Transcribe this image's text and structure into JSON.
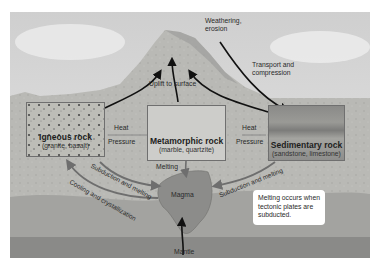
{
  "diagram": {
    "rocks": {
      "igneous": {
        "name": "Igneous rock",
        "examples": "(granite, basalt)"
      },
      "metamorphic": {
        "name": "Metamorphic rock",
        "examples": "(marble, quartzite)"
      },
      "sedimentary": {
        "name": "Sedimentary rock",
        "examples": "(sandstone, limestone)"
      }
    },
    "labels": {
      "weathering": "Weathering,",
      "erosion": "erosion",
      "transport_1": "Transport and",
      "transport_2": "compression",
      "uplift": "Uplift to surface",
      "heat_left": "Heat",
      "pressure_left": "Pressure",
      "heat_right": "Heat",
      "pressure_right": "Pressure",
      "melting": "Melting",
      "magma": "Magma",
      "mantle": "Mantle",
      "subduction_left": "Subduction and melting",
      "subduction_right": "Subduction and melting",
      "cooling": "Cooling and crystallization"
    },
    "note": {
      "line1": "Melting occurs when",
      "line2": "tectonic plates are",
      "line3": "subducted."
    },
    "colors": {
      "sky": "#dcdcdc",
      "mountain": "#c9c9c5",
      "crust": "#bdbdb9",
      "lower_crust": "#a3a3a0",
      "mantle": "#8a8a88",
      "magma": "#8c8c8a",
      "sea": "#a9a9a9",
      "arrow_black": "#111111",
      "arrow_gray": "#6e6e6e"
    }
  }
}
